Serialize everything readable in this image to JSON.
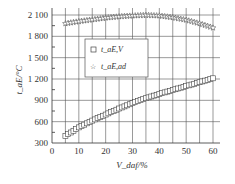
{
  "chart_data": {
    "type": "scatter",
    "title": "",
    "xlabel": "V_daf/%",
    "ylabel": "t_aE/°C",
    "xlim": [
      0,
      62
    ],
    "ylim": [
      300,
      2150
    ],
    "xticks": [
      0,
      10,
      20,
      30,
      40,
      50,
      60
    ],
    "yticks": [
      300,
      600,
      900,
      1200,
      1500,
      1800,
      2100
    ],
    "xtick_labels": [
      "0",
      "10",
      "20",
      "30",
      "40",
      "50",
      "60"
    ],
    "ytick_labels": [
      "300",
      "600",
      "900",
      "1 200",
      "1 500",
      "1 800",
      "2 100"
    ],
    "grid": true,
    "legend": {
      "placement": "upper-left-inside"
    },
    "series": [
      {
        "name": "t_aE,V",
        "marker": "square",
        "x": [
          5,
          10,
          15,
          20,
          25,
          30,
          35,
          40,
          45,
          50,
          55,
          60
        ],
        "y": [
          400,
          520,
          615,
          700,
          785,
          860,
          930,
          990,
          1045,
          1100,
          1155,
          1210
        ]
      },
      {
        "name": "t_aE,ad",
        "marker": "star",
        "x": [
          5,
          10,
          15,
          20,
          25,
          30,
          35,
          40,
          45,
          50,
          55,
          60
        ],
        "y": [
          1980,
          2010,
          2035,
          2060,
          2078,
          2090,
          2098,
          2090,
          2065,
          2030,
          1980,
          1920
        ]
      }
    ]
  }
}
